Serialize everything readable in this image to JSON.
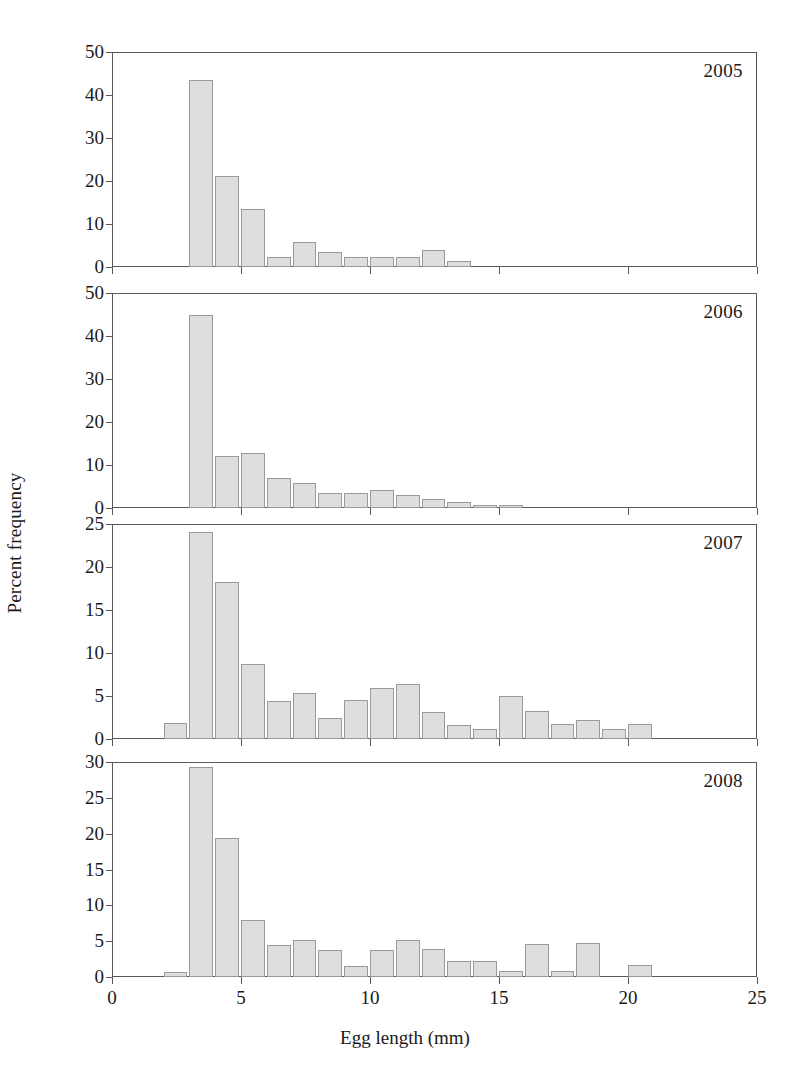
{
  "figure": {
    "xlabel": "Egg length (mm)",
    "ylabel": "Percent frequency",
    "bar_fill": "#dedede",
    "bar_stroke": "#9a9a9a",
    "axis_color": "#595959"
  },
  "chart_data": {
    "type": "bar",
    "title": "",
    "xlabel": "Egg length (mm)",
    "ylabel": "Percent frequency",
    "xlim": [
      0,
      25
    ],
    "xticks": [
      0,
      5,
      10,
      15,
      20,
      25
    ],
    "xticklabels": [
      "0",
      "5",
      "10",
      "15",
      "20",
      "25"
    ],
    "grid": false,
    "legend": "none",
    "bin_width": 1,
    "note": "Four stacked histogram panels, one per year; x values are the left edge of each 1 mm bin.",
    "panels": [
      {
        "year": "2005",
        "ylim": [
          0,
          50
        ],
        "yticks": [
          0,
          10,
          20,
          30,
          40,
          50
        ],
        "yticklabels": [
          "0",
          "10",
          "20",
          "30",
          "40",
          "50"
        ],
        "x": [
          2,
          3,
          4,
          5,
          6,
          7,
          8,
          9,
          10,
          11,
          12,
          13
        ],
        "values": [
          0,
          43.5,
          21.1,
          13.5,
          2.3,
          5.9,
          3.6,
          2.4,
          2.4,
          2.4,
          4.0,
          1.5
        ]
      },
      {
        "year": "2006",
        "ylim": [
          0,
          50
        ],
        "yticks": [
          0,
          10,
          20,
          30,
          40,
          50
        ],
        "yticklabels": [
          "0",
          "10",
          "20",
          "30",
          "40",
          "50"
        ],
        "x": [
          2,
          3,
          4,
          5,
          6,
          7,
          8,
          9,
          10,
          11,
          12,
          13,
          14,
          15
        ],
        "values": [
          0,
          45.0,
          12.1,
          12.8,
          7.0,
          5.9,
          3.5,
          3.6,
          4.2,
          3.0,
          2.0,
          1.3,
          0.8,
          0.7
        ]
      },
      {
        "year": "2007",
        "ylim": [
          0,
          25
        ],
        "yticks": [
          0,
          5,
          10,
          15,
          20,
          25
        ],
        "yticklabels": [
          "0",
          "5",
          "10",
          "15",
          "20",
          "25"
        ],
        "x": [
          2,
          3,
          4,
          5,
          6,
          7,
          8,
          9,
          10,
          11,
          12,
          13,
          14,
          15,
          16,
          17,
          18,
          19,
          20
        ],
        "values": [
          1.9,
          24.1,
          18.3,
          8.7,
          4.4,
          5.4,
          2.5,
          4.5,
          5.9,
          6.4,
          3.1,
          1.6,
          1.2,
          5.0,
          3.2,
          1.7,
          2.2,
          1.2,
          1.7
        ]
      },
      {
        "year": "2008",
        "ylim": [
          0,
          30
        ],
        "yticks": [
          0,
          5,
          10,
          15,
          20,
          25,
          30
        ],
        "yticklabels": [
          "0",
          "5",
          "10",
          "15",
          "20",
          "25",
          "30"
        ],
        "x": [
          2,
          3,
          4,
          5,
          6,
          7,
          8,
          9,
          10,
          11,
          12,
          13,
          14,
          15,
          16,
          17,
          18,
          19,
          20
        ],
        "values": [
          0.7,
          29.3,
          19.4,
          7.9,
          4.4,
          5.1,
          3.7,
          1.6,
          3.7,
          5.2,
          3.9,
          2.3,
          2.3,
          0.9,
          4.6,
          0.9,
          4.7,
          0,
          1.7
        ]
      }
    ]
  }
}
